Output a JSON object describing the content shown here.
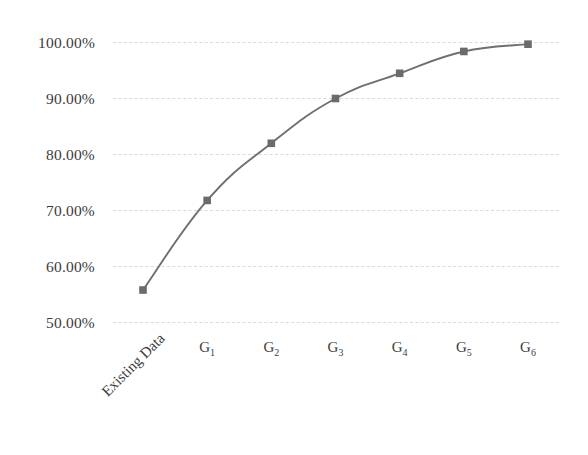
{
  "chart_data": {
    "type": "line",
    "title": "",
    "subtitle": "",
    "xlabel": "",
    "ylabel": "",
    "categories": [
      "Existing Data",
      "G1",
      "G2",
      "G3",
      "G4",
      "G5",
      "G6"
    ],
    "category_labels": [
      {
        "base": "Existing Data",
        "sub": "",
        "rotated": true
      },
      {
        "base": "G",
        "sub": "1",
        "rotated": false
      },
      {
        "base": "G",
        "sub": "2",
        "rotated": false
      },
      {
        "base": "G",
        "sub": "3",
        "rotated": false
      },
      {
        "base": "G",
        "sub": "4",
        "rotated": false
      },
      {
        "base": "G",
        "sub": "5",
        "rotated": false
      },
      {
        "base": "G",
        "sub": "6",
        "rotated": false
      }
    ],
    "values": [
      55.8,
      71.8,
      82.0,
      90.0,
      94.5,
      98.4,
      99.7
    ],
    "value_labels": [
      "55.80%",
      "71.80%",
      "82.00%",
      "90.00%",
      "94.50%",
      "98.40%",
      "99.70%"
    ],
    "ylim": [
      50,
      100
    ],
    "ytick_values": [
      50,
      60,
      70,
      80,
      90,
      100
    ],
    "ytick_labels": [
      "50.00%",
      "60.00%",
      "70.00%",
      "80.00%",
      "90.00%",
      "100.00%"
    ],
    "grid": true,
    "grid_axis": "y",
    "legend": false,
    "legend_position": "none",
    "marker": "square",
    "smooth": true,
    "series": [
      {
        "name": "Cumulative Coverage",
        "values": [
          55.8,
          71.8,
          82.0,
          90.0,
          94.5,
          98.4,
          99.7
        ]
      }
    ],
    "colors": {
      "line": "#6f6f6f",
      "marker": "#6b6b6b",
      "grid": "#d8d8e2",
      "background": "#ffffff",
      "text": "#3c3c3c"
    }
  }
}
